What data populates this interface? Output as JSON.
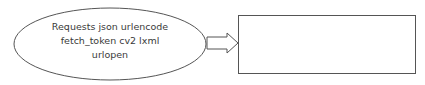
{
  "diagram": {
    "ellipse": {
      "lines": [
        "Requests json urlencode",
        "fetch_token cv2 lxml",
        "urlopen"
      ],
      "stroke": "#555555",
      "fill": "#ffffff"
    },
    "arrow": {
      "direction": "right",
      "stroke": "#555555"
    },
    "box": {
      "text": "",
      "stroke": "#555555",
      "fill": "#ffffff"
    }
  }
}
